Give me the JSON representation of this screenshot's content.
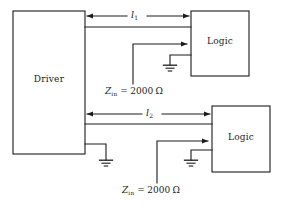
{
  "diagram": {
    "type": "circuit-schematic",
    "title_visible": false,
    "colors": {
      "line": "#1a1a1a",
      "background": "#ffffff",
      "text": "#1a1a1a"
    },
    "blocks": [
      {
        "id": "driver",
        "label": "Driver",
        "x": 13,
        "y": 11,
        "w": 72,
        "h": 143
      },
      {
        "id": "logic-top",
        "label": "Logic",
        "x": 191,
        "y": 11,
        "w": 58,
        "h": 65
      },
      {
        "id": "logic-bottom",
        "label": "Logic",
        "x": 212,
        "y": 106,
        "w": 58,
        "h": 66
      }
    ],
    "length_labels": [
      {
        "id": "l1",
        "symbol": "l",
        "subscript": "1",
        "x": 131,
        "y": 9
      },
      {
        "id": "l2",
        "symbol": "l",
        "subscript": "2",
        "x": 146,
        "y": 107
      }
    ],
    "impedance_labels": [
      {
        "id": "zin-top",
        "symbol": "Z",
        "subscript": "in",
        "operator": "=",
        "value": "2000",
        "unit": "Ω",
        "full_text": "Z_in = 2000 Ω",
        "x": 105,
        "y": 86
      },
      {
        "id": "zin-bottom",
        "symbol": "Z",
        "subscript": "in",
        "operator": "=",
        "value": "2000",
        "unit": "Ω",
        "full_text": "Z_in = 2000 Ω",
        "x": 122,
        "y": 185
      }
    ],
    "grounds": [
      {
        "id": "ground-logic-top",
        "x": 170,
        "y": 65
      },
      {
        "id": "ground-driver",
        "x": 106,
        "y": 160
      },
      {
        "id": "ground-logic-bottom",
        "x": 191,
        "y": 160
      }
    ],
    "dimension_arrows": [
      {
        "id": "l1-dimension",
        "from_x": 85,
        "to_x": 191,
        "y": 16,
        "double_headed": true
      },
      {
        "id": "l2-dimension",
        "from_x": 85,
        "to_x": 212,
        "y": 114,
        "double_headed": true
      }
    ],
    "transmission_lines": [
      {
        "id": "line-1",
        "from_x": 85,
        "to_x": 191,
        "y": 27
      },
      {
        "id": "line-2",
        "from_x": 85,
        "to_x": 212,
        "y": 124
      }
    ],
    "pointers": [
      {
        "id": "zin-top-pointer",
        "vx": 133,
        "vy_bottom": 84,
        "vy_top": 44,
        "arrow_to_x": 191
      },
      {
        "id": "zin-bottom-pointer",
        "vx": 157,
        "vy_bottom": 183,
        "vy_top": 141,
        "arrow_to_x": 212
      }
    ]
  }
}
